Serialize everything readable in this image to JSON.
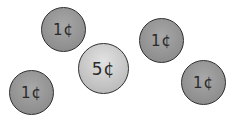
{
  "coins": [
    {
      "label": "1¢",
      "value": 1,
      "type": "penny"
    },
    {
      "label": "5¢",
      "value": 5,
      "type": "nickel"
    },
    {
      "label": "1¢",
      "value": 1,
      "type": "penny"
    },
    {
      "label": "1¢",
      "value": 1,
      "type": "penny"
    },
    {
      "label": "1¢",
      "value": 1,
      "type": "penny"
    }
  ]
}
